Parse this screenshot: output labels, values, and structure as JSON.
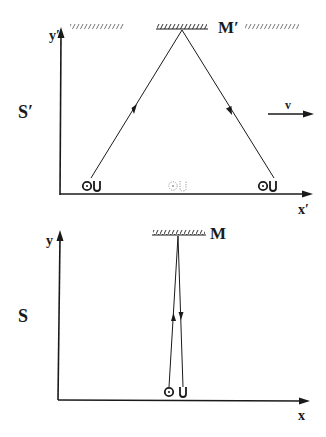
{
  "diagram": {
    "type": "light-clock thought experiment",
    "colors": {
      "ink": "#1a1a1a",
      "ghost": "#999999",
      "background": "#ffffff"
    }
  },
  "top_frame": {
    "frame_label": "S′",
    "y_axis_label": "y′",
    "x_axis_label": "x′",
    "mirror_label": "M′",
    "velocity_label": "v",
    "observer_glyph_left": "OU",
    "observer_glyph_middle": "OU",
    "observer_glyph_right": "OU"
  },
  "bottom_frame": {
    "frame_label": "S",
    "y_axis_label": "y",
    "x_axis_label": "x",
    "mirror_label": "M",
    "observer_glyph": "OU"
  }
}
